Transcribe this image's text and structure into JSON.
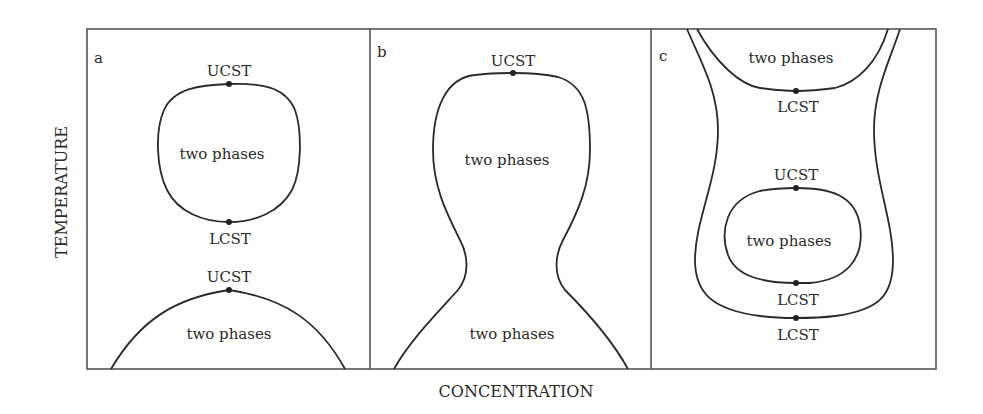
{
  "figure": {
    "x_axis_label": "CONCENTRATION",
    "y_axis_label": "TEMPERATURE",
    "panels": [
      {
        "id": "a",
        "label": "a",
        "regions": [
          {
            "text": "two phases",
            "type": "closed-loop",
            "critical_points": [
              {
                "label": "UCST",
                "position": "top"
              },
              {
                "label": "LCST",
                "position": "bottom"
              }
            ]
          },
          {
            "text": "two phases",
            "type": "dome",
            "critical_points": [
              {
                "label": "UCST",
                "position": "top"
              }
            ]
          }
        ],
        "texts": {
          "loop_ucst": "UCST",
          "loop_region": "two phases",
          "loop_lcst": "LCST",
          "dome_ucst": "UCST",
          "dome_region": "two phases"
        }
      },
      {
        "id": "b",
        "label": "b",
        "regions": [
          {
            "text": "two phases",
            "type": "hourglass-upper",
            "critical_points": [
              {
                "label": "UCST",
                "position": "top"
              }
            ]
          },
          {
            "text": "two phases",
            "type": "hourglass-lower",
            "critical_points": []
          }
        ],
        "texts": {
          "ucst": "UCST",
          "upper_region": "two phases",
          "lower_region": "two phases"
        }
      },
      {
        "id": "c",
        "label": "c",
        "regions": [
          {
            "text": "two phases",
            "type": "upper-bowl",
            "critical_points": [
              {
                "label": "LCST",
                "position": "bottom"
              }
            ]
          },
          {
            "text": "two phases",
            "type": "closed-loop",
            "critical_points": [
              {
                "label": "UCST",
                "position": "top"
              },
              {
                "label": "LCST",
                "position": "bottom"
              }
            ]
          },
          {
            "text": "",
            "type": "outer-U",
            "critical_points": [
              {
                "label": "LCST",
                "position": "bottom"
              }
            ]
          }
        ],
        "texts": {
          "top_region": "two phases",
          "top_lcst": "LCST",
          "loop_ucst": "UCST",
          "loop_region": "two phases",
          "loop_lcst": "LCST",
          "outer_lcst": "LCST"
        }
      }
    ]
  },
  "colors": {
    "line": "#2a2a2a",
    "frame": "#555555",
    "background": "#ffffff"
  }
}
